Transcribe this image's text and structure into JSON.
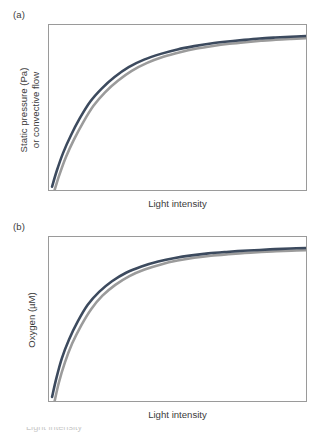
{
  "figure": {
    "panels": [
      {
        "label": "(a)",
        "ylabel_line1": "Static pressure (Pa)",
        "ylabel_line2": "or convective flow",
        "xlabel": "Light intensity"
      },
      {
        "label": "(b)",
        "ylabel_line1": "Oxygen (µM)",
        "ylabel_line2": "",
        "xlabel": "Light intensity"
      }
    ],
    "caption_partial": "Light intensity      "
  },
  "colors": {
    "curve_dark": "#3c4a5e",
    "curve_gray": "#9b9b9b",
    "frame": "#9a9a9a",
    "text": "#3c3c3c",
    "background": "#ffffff"
  },
  "chart_data": [
    {
      "type": "line",
      "title": "(a)",
      "xlabel": "Light intensity",
      "ylabel": "Static pressure (Pa) or convective flow",
      "xlim": [
        0,
        1
      ],
      "ylim": [
        0,
        1
      ],
      "grid": false,
      "legend": "none",
      "axis_ticks": "none",
      "series": [
        {
          "name": "curve-dark",
          "color": "#3c4a5e",
          "x": [
            0.012,
            0.03,
            0.055,
            0.085,
            0.12,
            0.16,
            0.205,
            0.255,
            0.31,
            0.37,
            0.435,
            0.5,
            0.565,
            0.63,
            0.695,
            0.76,
            0.82,
            0.88,
            0.94,
            1.0
          ],
          "y": [
            0.02,
            0.115,
            0.225,
            0.33,
            0.435,
            0.535,
            0.615,
            0.685,
            0.745,
            0.79,
            0.825,
            0.852,
            0.872,
            0.888,
            0.9,
            0.91,
            0.918,
            0.924,
            0.929,
            0.933
          ]
        },
        {
          "name": "curve-gray",
          "color": "#9b9b9b",
          "x": [
            0.022,
            0.04,
            0.066,
            0.097,
            0.133,
            0.173,
            0.218,
            0.268,
            0.322,
            0.382,
            0.445,
            0.51,
            0.575,
            0.638,
            0.702,
            0.765,
            0.825,
            0.883,
            0.942,
            1.0
          ],
          "y": [
            0.0,
            0.09,
            0.2,
            0.305,
            0.41,
            0.51,
            0.592,
            0.662,
            0.722,
            0.77,
            0.807,
            0.835,
            0.857,
            0.873,
            0.886,
            0.896,
            0.904,
            0.911,
            0.916,
            0.92
          ]
        }
      ]
    },
    {
      "type": "line",
      "title": "(b)",
      "xlabel": "Light intensity",
      "ylabel": "Oxygen (µM)",
      "xlim": [
        0,
        1
      ],
      "ylim": [
        0,
        1
      ],
      "grid": false,
      "legend": "none",
      "axis_ticks": "none",
      "series": [
        {
          "name": "curve-dark",
          "color": "#3c4a5e",
          "x": [
            0.012,
            0.028,
            0.05,
            0.078,
            0.112,
            0.15,
            0.195,
            0.245,
            0.3,
            0.36,
            0.425,
            0.49,
            0.555,
            0.62,
            0.69,
            0.755,
            0.82,
            0.88,
            0.94,
            1.0
          ],
          "y": [
            0.025,
            0.135,
            0.26,
            0.375,
            0.485,
            0.585,
            0.665,
            0.73,
            0.782,
            0.82,
            0.85,
            0.872,
            0.888,
            0.9,
            0.909,
            0.916,
            0.921,
            0.926,
            0.93,
            0.933
          ]
        },
        {
          "name": "curve-gray",
          "color": "#9b9b9b",
          "x": [
            0.022,
            0.038,
            0.062,
            0.09,
            0.125,
            0.164,
            0.208,
            0.258,
            0.313,
            0.372,
            0.436,
            0.5,
            0.565,
            0.63,
            0.698,
            0.762,
            0.826,
            0.885,
            0.943,
            1.0
          ],
          "y": [
            0.0,
            0.11,
            0.235,
            0.35,
            0.46,
            0.56,
            0.642,
            0.708,
            0.762,
            0.802,
            0.833,
            0.856,
            0.873,
            0.886,
            0.895,
            0.902,
            0.908,
            0.913,
            0.917,
            0.92
          ]
        }
      ]
    }
  ]
}
